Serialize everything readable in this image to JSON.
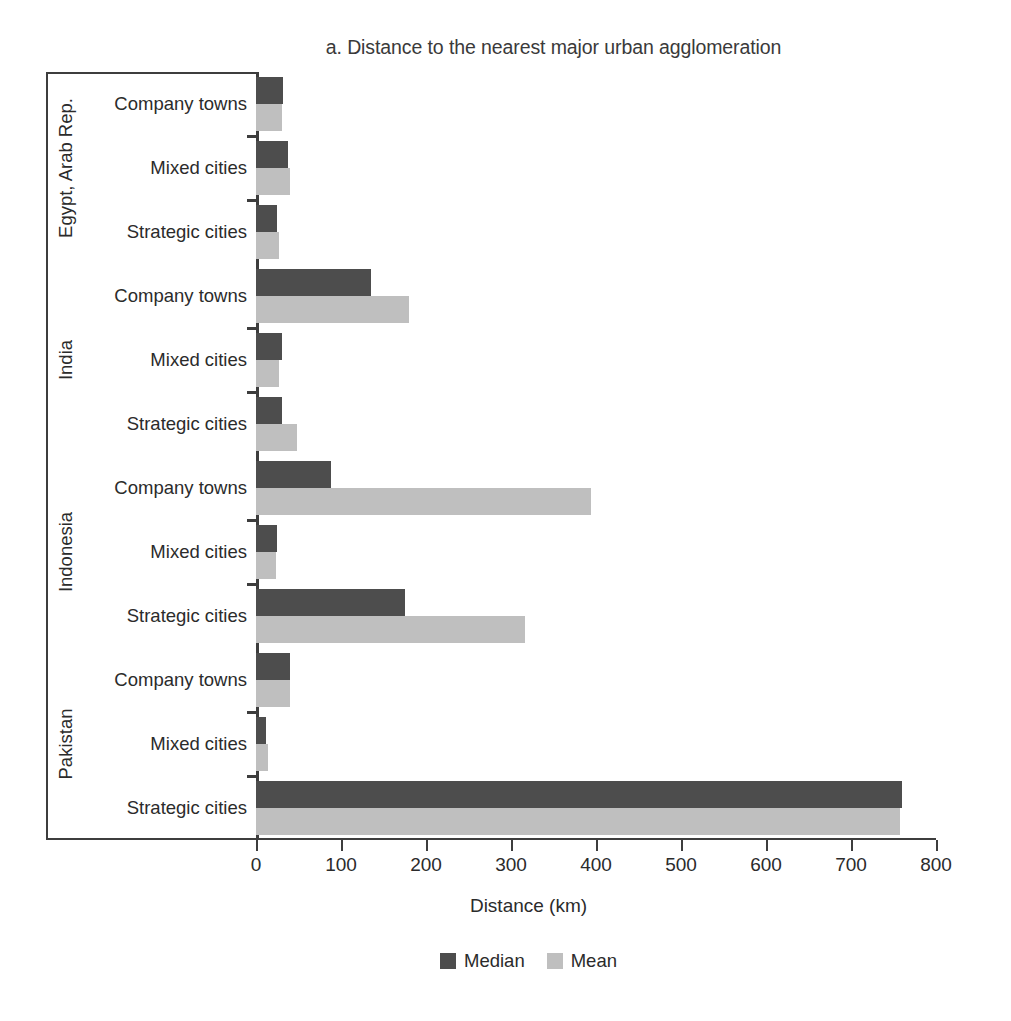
{
  "chart_data": {
    "type": "bar",
    "orientation": "horizontal",
    "title": "a. Distance to the nearest major urban agglomeration",
    "xlabel": "Distance (km)",
    "ylabel": "",
    "xlim": [
      0,
      800
    ],
    "xticks": [
      0,
      100,
      200,
      300,
      400,
      500,
      600,
      700,
      800
    ],
    "grid": false,
    "legend_position": "bottom",
    "series": [
      {
        "name": "Median",
        "color": "#4d4d4d"
      },
      {
        "name": "Mean",
        "color": "#bfbfbf"
      }
    ],
    "groups": [
      {
        "country": "Egypt, Arab Rep.",
        "categories": [
          "Company towns",
          "Mixed cities",
          "Strategic cities"
        ],
        "median": [
          32,
          38,
          25
        ],
        "mean": [
          30,
          40,
          27
        ]
      },
      {
        "country": "India",
        "categories": [
          "Company towns",
          "Mixed cities",
          "Strategic cities"
        ],
        "median": [
          135,
          30,
          30
        ],
        "mean": [
          180,
          27,
          48
        ]
      },
      {
        "country": "Indonesia",
        "categories": [
          "Company towns",
          "Mixed cities",
          "Strategic cities"
        ],
        "median": [
          88,
          25,
          175
        ],
        "mean": [
          394,
          24,
          316
        ]
      },
      {
        "country": "Pakistan",
        "categories": [
          "Company towns",
          "Mixed cities",
          "Strategic cities"
        ],
        "median": [
          40,
          12,
          760
        ],
        "mean": [
          40,
          14,
          758
        ]
      }
    ]
  },
  "legend": {
    "items": [
      {
        "label": "Median",
        "color": "#4d4d4d"
      },
      {
        "label": "Mean",
        "color": "#bfbfbf"
      }
    ]
  }
}
